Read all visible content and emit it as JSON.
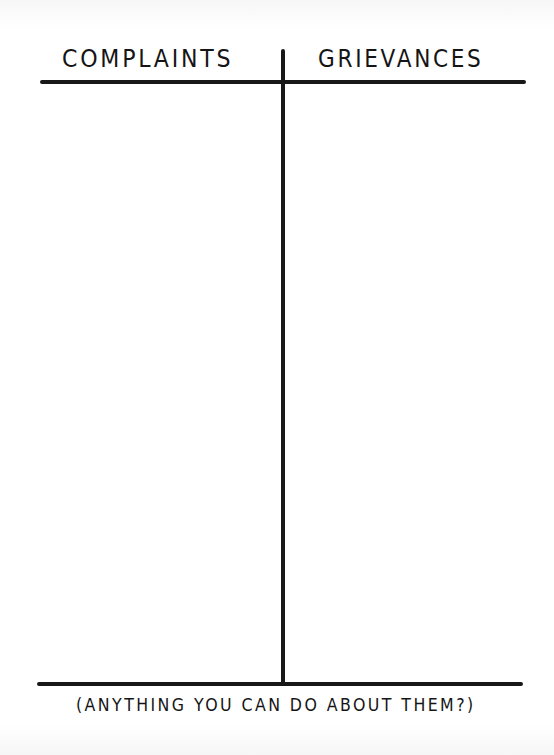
{
  "chart": {
    "type": "t-chart",
    "columns": [
      {
        "heading": "COMPLAINTS",
        "entries": []
      },
      {
        "heading": "GRIEVANCES",
        "entries": []
      }
    ],
    "footer_caption": "(ANYTHING YOU CAN DO ABOUT THEM?)"
  },
  "colors": {
    "ink": "#181818",
    "paper": "#ffffff"
  }
}
